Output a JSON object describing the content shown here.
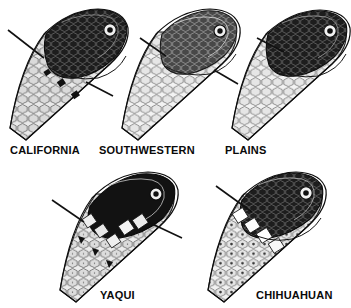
{
  "plate": {
    "title": "Snake head pattern variation plate",
    "background_color": "#ffffff",
    "ink_color": "#0a0a0a",
    "view": "dorsolateral head",
    "figure_count": 5,
    "rows": 2
  },
  "figures": [
    {
      "id": "california",
      "label": "CALIFORNIA",
      "row": 1,
      "column": 1,
      "label_x": 10,
      "label_y": 145,
      "head_x": 6,
      "head_y": 8,
      "head_w": 130,
      "head_h": 128,
      "head_rotation_deg": -32,
      "crown_tone": "very-dark",
      "crown_fill": "#1b1b1b",
      "body_scale_tone": "#cfcfcf",
      "scale_pattern": "hexagonal-stippled",
      "has_dark_blotches": true,
      "leader_lines": [
        {
          "name": "upper-left-leader",
          "x1": 8,
          "y1": 30,
          "x2": 44,
          "y2": 58
        },
        {
          "name": "lower-right-leader",
          "x1": 86,
          "y1": 82,
          "x2": 113,
          "y2": 96
        }
      ]
    },
    {
      "id": "southwestern",
      "label": "SOUTHWESTERN",
      "row": 1,
      "column": 2,
      "label_x": 99,
      "label_y": 145,
      "head_x": 118,
      "head_y": 8,
      "head_w": 120,
      "head_h": 128,
      "head_rotation_deg": -30,
      "crown_tone": "medium-dark",
      "crown_fill": "#3a3a3a",
      "body_scale_tone": "#d8d8d8",
      "scale_pattern": "hexagonal-plain",
      "has_dark_blotches": false,
      "leader_lines": [
        {
          "name": "upper-left-leader",
          "x1": 140,
          "y1": 38,
          "x2": 166,
          "y2": 56
        },
        {
          "name": "lower-right-leader",
          "x1": 214,
          "y1": 70,
          "x2": 238,
          "y2": 84
        }
      ]
    },
    {
      "id": "plains",
      "label": "PLAINS",
      "row": 1,
      "column": 3,
      "label_x": 225,
      "label_y": 145,
      "head_x": 228,
      "head_y": 10,
      "head_w": 120,
      "head_h": 128,
      "head_rotation_deg": -30,
      "crown_tone": "dark",
      "crown_fill": "#252525",
      "body_scale_tone": "#e0e0e0",
      "scale_pattern": "hexagonal-plain",
      "has_dark_blotches": false,
      "leader_lines": [
        {
          "name": "upper-left-leader",
          "x1": 257,
          "y1": 38,
          "x2": 284,
          "y2": 52
        }
      ]
    },
    {
      "id": "yaqui",
      "label": "YAQUI",
      "row": 2,
      "column": 1,
      "label_x": 100,
      "label_y": 290,
      "head_x": 56,
      "head_y": 172,
      "head_w": 128,
      "head_h": 126,
      "head_rotation_deg": -34,
      "crown_tone": "black",
      "crown_fill": "#121212",
      "body_scale_tone": "#d4d4d4",
      "scale_pattern": "hexagonal-dark-flecked",
      "has_dark_blotches": true,
      "leader_lines": [
        {
          "name": "upper-left-leader",
          "x1": 52,
          "y1": 200,
          "x2": 84,
          "y2": 222
        },
        {
          "name": "right-leader",
          "x1": 148,
          "y1": 222,
          "x2": 182,
          "y2": 238
        }
      ]
    },
    {
      "id": "chihuahuan",
      "label": "CHIHUAHUAN",
      "row": 2,
      "column": 2,
      "label_x": 256,
      "label_y": 290,
      "head_x": 204,
      "head_y": 172,
      "head_w": 128,
      "head_h": 126,
      "head_rotation_deg": -32,
      "crown_tone": "very-dark",
      "crown_fill": "#1e1e1e",
      "body_scale_tone": "#e2e2e2",
      "scale_pattern": "hexagonal-center-dotted",
      "has_dark_blotches": false,
      "leader_lines": [
        {
          "name": "upper-left-leader",
          "x1": 216,
          "y1": 186,
          "x2": 252,
          "y2": 212
        }
      ]
    }
  ]
}
